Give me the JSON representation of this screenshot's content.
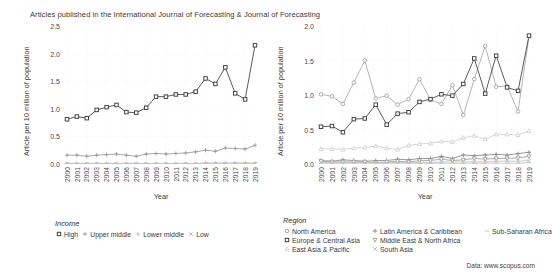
{
  "figure": {
    "title": "Articles published in the International Journal of Forecasting & Journal of Forecasting",
    "source_note": "Data: www.scopus.com",
    "background": "#ffffff",
    "grid_color": "#fbfbfb"
  },
  "panels": {
    "left": {
      "name": "income-panel",
      "ylabel": "Article per 10 million of population",
      "xlabel": "Year",
      "legend_title": "Income"
    },
    "right": {
      "name": "region-panel",
      "ylabel": "Article per 10 million of population",
      "xlabel": "Year",
      "legend_title": "Region"
    }
  },
  "chart_data": [
    {
      "type": "line",
      "id": "income",
      "title": "Articles published in the International Journal of Forecasting & Journal of Forecasting",
      "xlabel": "Year",
      "ylabel": "Article per 10 million of population",
      "xlim": [
        2000,
        2019
      ],
      "ylim": [
        0.0,
        2.5
      ],
      "yticks": [
        "0.0",
        "0.5",
        "1.0",
        "1.5",
        "2.0",
        "2.5"
      ],
      "grid": true,
      "legend_position": "below",
      "legend_title": "Income",
      "categories": [
        "2000",
        "2001",
        "2002",
        "2003",
        "2004",
        "2005",
        "2006",
        "2007",
        "2008",
        "2009",
        "2010",
        "2011",
        "2012",
        "2013",
        "2014",
        "2015",
        "2016",
        "2017",
        "2018",
        "2019"
      ],
      "series": [
        {
          "name": "High",
          "marker": "square",
          "color": "#3c3c3c",
          "values": [
            0.81,
            0.86,
            0.83,
            0.98,
            1.03,
            1.07,
            0.94,
            0.93,
            1.02,
            1.22,
            1.22,
            1.26,
            1.26,
            1.31,
            1.55,
            1.45,
            1.75,
            1.28,
            1.17,
            2.15
          ]
        },
        {
          "name": "Upper middle",
          "marker": "plus",
          "color": "#9a9a9a",
          "values": [
            0.16,
            0.16,
            0.14,
            0.16,
            0.17,
            0.18,
            0.16,
            0.14,
            0.18,
            0.19,
            0.18,
            0.19,
            0.2,
            0.22,
            0.25,
            0.23,
            0.29,
            0.28,
            0.27,
            0.34
          ]
        },
        {
          "name": "Lower middle",
          "marker": "plus",
          "color": "#c2c2c2",
          "values": [
            0.01,
            0.01,
            0.01,
            0.01,
            0.01,
            0.01,
            0.01,
            0.01,
            0.01,
            0.01,
            0.01,
            0.01,
            0.01,
            0.01,
            0.02,
            0.02,
            0.02,
            0.02,
            0.02,
            0.02
          ]
        },
        {
          "name": "Low",
          "marker": "cross",
          "color": "#b0b0b0",
          "values": [
            0.0,
            0.0,
            0.0,
            0.0,
            0.0,
            0.0,
            0.0,
            0.0,
            0.0,
            0.0,
            0.0,
            0.0,
            0.0,
            0.0,
            0.0,
            0.0,
            0.0,
            0.0,
            0.0,
            0.0
          ]
        }
      ]
    },
    {
      "type": "line",
      "id": "region",
      "title": "Articles published in the International Journal of Forecasting & Journal of Forecasting",
      "xlabel": "Year",
      "ylabel": "Article per 10 million of population",
      "xlim": [
        2000,
        2019
      ],
      "ylim": [
        0.0,
        2.0
      ],
      "yticks": [
        "0.0",
        "0.5",
        "1.0",
        "1.5",
        "2.0"
      ],
      "grid": true,
      "legend_position": "below",
      "legend_title": "Region",
      "categories": [
        "2000",
        "2001",
        "2002",
        "2003",
        "2004",
        "2005",
        "2006",
        "2007",
        "2008",
        "2009",
        "2010",
        "2011",
        "2012",
        "2013",
        "2014",
        "2015",
        "2016",
        "2017",
        "2018",
        "2019"
      ],
      "series": [
        {
          "name": "North America",
          "marker": "circle",
          "color": "#a8a8a8",
          "values": [
            1.01,
            0.98,
            0.87,
            1.18,
            1.5,
            0.95,
            0.99,
            0.86,
            0.94,
            1.23,
            0.93,
            0.87,
            1.14,
            0.71,
            1.23,
            1.71,
            1.12,
            1.13,
            0.76,
            1.85
          ]
        },
        {
          "name": "Europe & Central Asia",
          "marker": "square",
          "color": "#3c3c3c",
          "values": [
            0.54,
            0.55,
            0.46,
            0.65,
            0.66,
            0.86,
            0.57,
            0.73,
            0.75,
            0.9,
            0.94,
            1.01,
            0.99,
            1.16,
            1.53,
            1.02,
            1.57,
            1.11,
            1.06,
            1.86
          ]
        },
        {
          "name": "East Asia & Pacific",
          "marker": "triangle",
          "color": "#cfcfcf",
          "values": [
            0.22,
            0.22,
            0.21,
            0.23,
            0.24,
            0.26,
            0.23,
            0.21,
            0.27,
            0.29,
            0.3,
            0.33,
            0.32,
            0.38,
            0.41,
            0.36,
            0.43,
            0.43,
            0.42,
            0.48
          ]
        },
        {
          "name": "Latin America & Caribbean",
          "marker": "plus",
          "color": "#868686",
          "values": [
            0.05,
            0.04,
            0.06,
            0.05,
            0.04,
            0.05,
            0.05,
            0.07,
            0.06,
            0.08,
            0.08,
            0.11,
            0.08,
            0.13,
            0.12,
            0.13,
            0.14,
            0.13,
            0.15,
            0.17
          ]
        },
        {
          "name": "Middle East & North Africa",
          "marker": "triangle-down",
          "color": "#9e9e9e",
          "values": [
            0.04,
            0.03,
            0.03,
            0.03,
            0.03,
            0.02,
            0.03,
            0.04,
            0.03,
            0.05,
            0.05,
            0.07,
            0.05,
            0.06,
            0.08,
            0.07,
            0.08,
            0.08,
            0.09,
            0.11
          ]
        },
        {
          "name": "South Asia",
          "marker": "cross",
          "color": "#bdbdbd",
          "values": [
            0.02,
            0.02,
            0.02,
            0.02,
            0.02,
            0.02,
            0.02,
            0.02,
            0.02,
            0.02,
            0.02,
            0.03,
            0.03,
            0.03,
            0.03,
            0.03,
            0.04,
            0.04,
            0.04,
            0.05
          ]
        },
        {
          "name": "Sub-Saharan Africa",
          "marker": "dash",
          "color": "#c8c8c8",
          "values": [
            0.01,
            0.01,
            0.01,
            0.01,
            0.01,
            0.01,
            0.01,
            0.01,
            0.01,
            0.01,
            0.01,
            0.01,
            0.01,
            0.01,
            0.01,
            0.01,
            0.01,
            0.01,
            0.01,
            0.02
          ]
        }
      ]
    }
  ]
}
